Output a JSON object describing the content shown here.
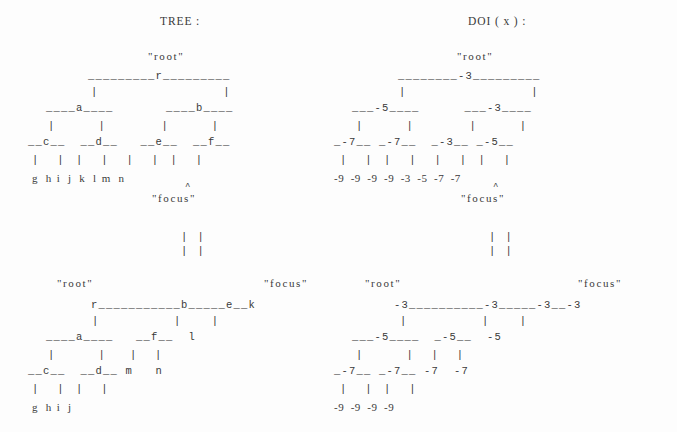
{
  "figure": {
    "background_color": "#fdfdfd",
    "text_color": "#3a3a3a"
  },
  "headers": {
    "tree": "TREE :",
    "doi": "DOI ( x ) :"
  },
  "labels": {
    "root": "\"root\"",
    "focus": "\"focus\"",
    "caret": "^"
  },
  "transition": {
    "arrows_line1": "| |",
    "arrows_line2": "| |"
  },
  "panels": {
    "tree_full": {
      "name": "TREE :",
      "root_label": "\"root\"",
      "focus_label": "\"focus\"",
      "focus_node": "k",
      "rows": [
        "       _________r_________",
        "       |                 |",
        "   ____a____         ____b____",
        "   |       |         |       |",
        " __c__   __d__     __e__   __f__",
        " |   |   |   |     |   |   |   |",
        " g   h   i   j     k   l   m   n"
      ],
      "nodes": [
        "r",
        "a",
        "b",
        "c",
        "d",
        "e",
        "f",
        "g",
        "h",
        "i",
        "j",
        "k",
        "l",
        "m",
        "n"
      ]
    },
    "doi_full": {
      "name": "DOI ( x ) :",
      "root_label": "\"root\"",
      "focus_label": "\"focus\"",
      "rows": [
        "       ________-3_________",
        "       |                 |",
        "   ___-5____         ___-3____",
        "   |        |        |        |",
        " _-7__    _-7__    _-3__    _-5__",
        " |   |    |   |    |   |    |   |",
        "-9  -9   -9  -9   -3  -5   -7  -7"
      ],
      "values": {
        "r": -3,
        "a": -5,
        "b": -3,
        "c": -7,
        "d": -7,
        "e": -3,
        "f": -5,
        "g": -9,
        "h": -9,
        "i": -9,
        "j": -9,
        "k": -3,
        "l": -5,
        "m": -7,
        "n": -7
      }
    },
    "tree_pruned": {
      "root_label": "\"root\"",
      "focus_label": "\"focus\"",
      "rows": [
        "    r___________b_____e__k",
        "    |           |     |",
        "____a____     __f__   l",
        "|       |     |   |",
        "__c__ __d__   m   n",
        "|   | |   |",
        "g   h i   j"
      ],
      "nodes": [
        "r",
        "b",
        "e",
        "k",
        "a",
        "f",
        "l",
        "c",
        "d",
        "m",
        "n",
        "g",
        "h",
        "i",
        "j"
      ]
    },
    "doi_pruned": {
      "root_label": "\"root\"",
      "focus_label": "\"focus\"",
      "rows": [
        "   -3__________-3_____-3__-3",
        "    |           |      |",
        "___-5____     _-5__   -5",
        "|        |    |   |",
        "_-7__  _-7__  -7  -7",
        "|   |  |   |",
        "-9 -9  -9  -9"
      ],
      "values": {
        "r": -3,
        "b": -3,
        "e": -3,
        "k": -3,
        "a": -5,
        "f": -5,
        "l": -5,
        "c": -7,
        "d": -7,
        "m": -7,
        "n": -7,
        "g": -9,
        "h": -9,
        "i": -9,
        "j": -9
      }
    }
  }
}
